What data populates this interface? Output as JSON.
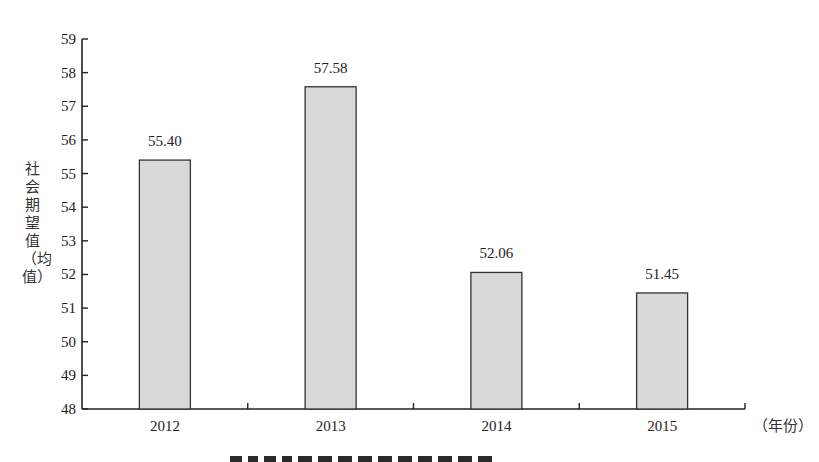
{
  "chart_data": {
    "type": "bar",
    "title": "",
    "xlabel": "（年份）",
    "ylabel": "社会期望值（均值）",
    "categories": [
      "2012",
      "2013",
      "2014",
      "2015"
    ],
    "values": [
      55.4,
      57.58,
      52.06,
      51.45
    ],
    "value_labels": [
      "55.40",
      "57.58",
      "52.06",
      "51.45"
    ],
    "ylim": [
      48,
      59
    ],
    "yticks": [
      48,
      49,
      50,
      51,
      52,
      53,
      54,
      55,
      56,
      57,
      58,
      59
    ],
    "grid": false,
    "legend": null,
    "bar_fill": "#d9d9d9",
    "bar_stroke": "#333333"
  }
}
